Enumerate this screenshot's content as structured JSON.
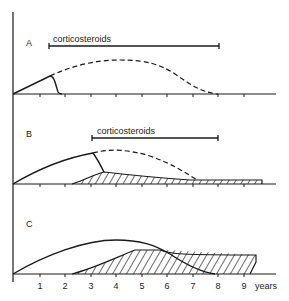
{
  "panels": [
    {
      "id": "A",
      "label": "A",
      "treatment_label": "corticosteroids",
      "treatment_start_year": 1.3,
      "treatment_end_year": 8.0
    },
    {
      "id": "B",
      "label": "B",
      "treatment_label": "corticosteroids",
      "treatment_start_year": 3.0,
      "treatment_end_year": 8.0
    },
    {
      "id": "C",
      "label": "C"
    }
  ],
  "x_axis": {
    "ticks": [
      "1",
      "2",
      "3",
      "4",
      "5",
      "6",
      "7",
      "8",
      "9"
    ],
    "unit_label": "years"
  },
  "legend_notes": {
    "solid_line": "observed disease course",
    "dashed_line": "expected course without treatment",
    "hatched_area": "steroid-related complications"
  },
  "colors": {
    "ink": "#1a1a1a",
    "background": "#ffffff"
  }
}
